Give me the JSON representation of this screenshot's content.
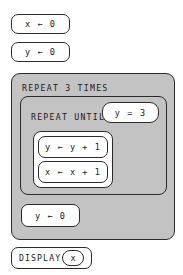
{
  "diagram": {
    "type": "block-based-pseudocode-program",
    "blocks": {
      "init_x": "x ← 0",
      "init_y": "y ← 0",
      "repeat_header": "REPEAT 3 TIMES",
      "repeat_until_header": "REPEAT UNTIL",
      "repeat_until_condition": "y = 3",
      "increment_y": "y ← y + 1",
      "increment_x": "x ← x + 1",
      "reset_y": "y ← 0",
      "display_label": "DISPLAY",
      "display_value": "x"
    }
  },
  "colors": {
    "block_fill": "#ffffff",
    "container_fill": "#c3c3c3",
    "outline": "#2b2b2b",
    "text": "#1a1a1a",
    "page_background": "#ffffff"
  }
}
